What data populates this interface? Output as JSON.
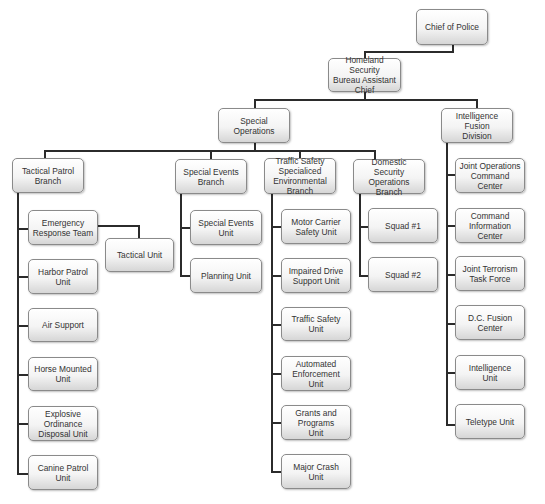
{
  "chart": {
    "type": "org-chart",
    "line_color": "#2b2b2b",
    "box_border": "#8a8a8a",
    "text_color": "#333333"
  },
  "nodes": {
    "chief": "Chief of Police",
    "homeland": "Homeland Security\nBureau Assistant\nChief",
    "special_ops": "Special\nOperations",
    "intel_fusion": "Intelligence\nFusion\nDivision",
    "tactical_patrol": "Tactical Patrol\nBranch",
    "special_events_branch": "Special Events\nBranch",
    "traffic_branch": "Traffic Safety\nSpecialiced\nEnvironmental\nBranch",
    "domestic_branch": "Domestic Security\nOperations Branch",
    "ert": "Emergency\nResponse Team",
    "tactical_unit": "Tactical Unit",
    "harbor": "Harbor Patrol\nUnit",
    "air": "Air Support",
    "horse": "Horse Mounted\nUnit",
    "explosive": "Explosive\nOrdinance\nDisposal Unit",
    "canine": "Canine Patrol\nUnit",
    "special_events_unit": "Special Events\nUnit",
    "planning": "Planning Unit",
    "motor_carrier": "Motor Carrier\nSafety Unit",
    "impaired": "Impaired Drive\nSupport Unit",
    "traffic_unit": "Traffic Safety\nUnit",
    "automated": "Automated\nEnforcement\nUnit",
    "grants": "Grants and\nPrograms\nUnit",
    "major_crash": "Major Crash\nUnit",
    "squad1": "Squad #1",
    "squad2": "Squad #2",
    "joint_ops": "Joint Operations\nCommand Center",
    "cmd_info": "Command\nInformation\nCenter",
    "jttf": "Joint Terrorism\nTask Force",
    "dc_fusion": "D.C. Fusion\nCenter",
    "intel_unit": "Intelligence\nUnit",
    "teletype": "Teletype Unit"
  }
}
